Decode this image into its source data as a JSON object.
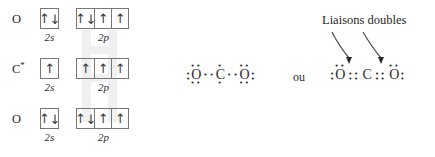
{
  "diagram": {
    "kind": "lewis-and-orbital-diagram-co2",
    "orbital_diagram": {
      "rows": [
        {
          "atom": "O",
          "star": "",
          "s_label": "2s",
          "p_label": "2p",
          "s_boxes": [
            {
              "arrows": "updown"
            }
          ],
          "p_boxes": [
            {
              "arrows": "updown"
            },
            {
              "arrows": "up"
            },
            {
              "arrows": "up"
            }
          ]
        },
        {
          "atom": "C",
          "star": "*",
          "s_label": "2s",
          "p_label": "2p",
          "s_boxes": [
            {
              "arrows": "up"
            }
          ],
          "p_boxes": [
            {
              "arrows": "up"
            },
            {
              "arrows": "up"
            },
            {
              "arrows": "up"
            }
          ]
        },
        {
          "atom": "O",
          "star": "",
          "s_label": "2s",
          "p_label": "2p",
          "s_boxes": [
            {
              "arrows": "updown"
            }
          ],
          "p_boxes": [
            {
              "arrows": "updown"
            },
            {
              "arrows": "up"
            },
            {
              "arrows": "up"
            }
          ]
        }
      ],
      "arrow_up_glyph": "↑",
      "arrow_down_glyph": "↓"
    },
    "lewis_single": {
      "name": "unpaired-electron-form",
      "atoms": [
        {
          "symbol": "O",
          "left_dots": 2,
          "top_dots": 2,
          "bottom_dots": 2,
          "right_dots": 0
        },
        {
          "symbol": "C",
          "left_dots": 0,
          "top_dots": 1,
          "bottom_dots": 1,
          "right_dots": 0
        },
        {
          "symbol": "O",
          "left_dots": 0,
          "top_dots": 2,
          "bottom_dots": 2,
          "right_dots": 2
        }
      ],
      "bond_dots_per_bond": 1,
      "dot_glyph": "•"
    },
    "lewis_double": {
      "name": "double-bond-form",
      "atoms": [
        {
          "symbol": "O",
          "left_dots": 2,
          "top_dots": 2,
          "bottom_dots": 0,
          "right_dots": 0
        },
        {
          "symbol": "C",
          "left_dots": 0,
          "top_dots": 0,
          "bottom_dots": 0,
          "right_dots": 0
        },
        {
          "symbol": "O",
          "left_dots": 0,
          "top_dots": 2,
          "bottom_dots": 0,
          "right_dots": 2
        }
      ],
      "bond_dots_per_bond": 2,
      "dot_glyph": "•"
    },
    "connector_label": "ou",
    "annotation": {
      "text": "Liaisons doubles",
      "arrow_count": 2
    },
    "colors": {
      "ink": "#2b2b2b",
      "box_stroke": "#777777",
      "watermark": "#e2e2e2",
      "background": "#ffffff"
    }
  }
}
